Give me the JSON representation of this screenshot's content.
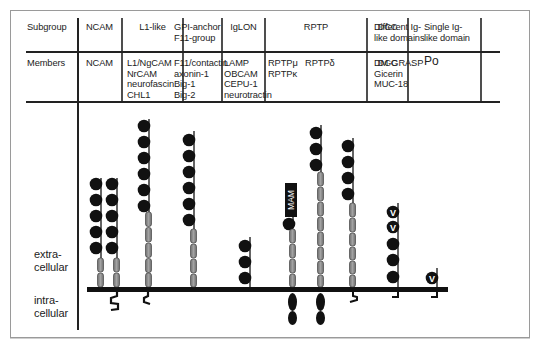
{
  "table": {
    "row_headers": {
      "subgroup": "Subgroup",
      "members": "Members"
    },
    "columns": [
      {
        "subgroup": "NCAM",
        "members": "NCAM"
      },
      {
        "subgroup": "L1-like",
        "members": "L1/NgCAM\nNrCAM\nneurofascin\nCHL1"
      },
      {
        "subgroup": "GPI-anchor\nF11-group",
        "members": "F11/contactin\naxonin-1\nBig-1\nBig-2"
      },
      {
        "subgroup": "IgLON",
        "members": "LAMP\nOBCAM\nCEPU-1\nneurotractin"
      },
      {
        "subgroup": "RPTP",
        "members": "RPTPμ   RPTPδ\nRPTPκ"
      },
      {
        "subgroup": "DCC",
        "members": "DCC"
      },
      {
        "subgroup": "Different Ig-\nlike domains",
        "members": "DM-GRASP\nGicerin\nMUC-18"
      },
      {
        "subgroup": "Single Ig-\nlike domain",
        "members": "Po"
      }
    ]
  },
  "diagram": {
    "labels": {
      "extracellular": "extra-\ncellular",
      "intracellular": "intra-\ncellular",
      "mam": "MAM",
      "v_domain": "V"
    },
    "legend_semantics": {
      "black_circle": "Ig-like domain",
      "grey_box": "fibronectin type III repeat",
      "v_circle": "V-type Ig domain",
      "mam_box": "MAM domain",
      "black_ellipse": "intracellular phosphatase domain"
    },
    "molecules": [
      {
        "name": "NCAM (GPI-anchored)",
        "ig": 5,
        "fn3": 2,
        "tail": "none"
      },
      {
        "name": "NCAM (transmembrane)",
        "ig": 5,
        "fn3": 2,
        "tail": "cytoplasmic"
      },
      {
        "name": "L1-like",
        "ig": 6,
        "fn3": 5,
        "tail": "cytoplasmic"
      },
      {
        "name": "GPI-anchor F11-group",
        "ig": 6,
        "fn3": 4,
        "tail": "none"
      },
      {
        "name": "IgLON",
        "ig": 3,
        "fn3": 0,
        "tail": "none"
      },
      {
        "name": "RPTPμ/κ",
        "mam": 1,
        "ig": 1,
        "fn3": 4,
        "tail": "phosphatase x2"
      },
      {
        "name": "RPTPδ",
        "ig": 3,
        "fn3": 8,
        "tail": "phosphatase x2"
      },
      {
        "name": "DCC",
        "ig": 4,
        "fn3": 6,
        "tail": "cytoplasmic"
      },
      {
        "name": "Different Ig-like domains",
        "v": 2,
        "ig": 3,
        "fn3": 0,
        "tail": "cytoplasmic"
      },
      {
        "name": "Single Ig-like domain (Po)",
        "v": 1,
        "ig": 0,
        "fn3": 0,
        "tail": "cytoplasmic"
      }
    ]
  },
  "colors": {
    "ink": "#111111",
    "fn3_fill": "#8a8a8a",
    "frame": "#9a9a9a"
  }
}
